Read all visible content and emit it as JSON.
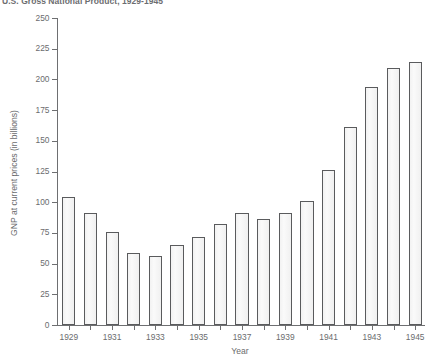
{
  "chart_data": {
    "type": "bar",
    "title": "U.S. Gross National Product, 1929-1945",
    "xlabel": "Year",
    "ylabel": "GNP at current prices (in billions)",
    "categories": [
      "1929",
      "1930",
      "1931",
      "1932",
      "1933",
      "1934",
      "1935",
      "1936",
      "1937",
      "1938",
      "1939",
      "1940",
      "1941",
      "1942",
      "1943",
      "1944",
      "1945"
    ],
    "values": [
      104,
      91,
      76,
      59,
      56,
      65,
      72,
      82,
      91,
      86,
      91,
      101,
      126,
      161,
      194,
      209,
      214
    ],
    "ylim": [
      0,
      250
    ],
    "yticks": [
      0,
      25,
      50,
      75,
      100,
      125,
      150,
      175,
      200,
      225,
      250
    ],
    "ytick_labels": [
      "0",
      "25",
      "50",
      "75",
      "100",
      "125",
      "150",
      "175",
      "200",
      "225",
      "250"
    ],
    "xtick_labels": [
      "1929",
      "1931",
      "1933",
      "1935",
      "1937",
      "1939",
      "1941",
      "1943",
      "1945"
    ],
    "grid": false,
    "legend": false,
    "bar_fill_color": "#f4f4f4",
    "bar_edge_color": "#5a5b5d",
    "axis_color": "#6e6f71",
    "text_color": "#6b6c6e"
  }
}
